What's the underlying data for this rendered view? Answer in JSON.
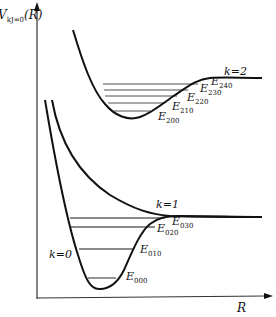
{
  "diagram": {
    "y_axis_label": "V",
    "y_axis_sub": "kJ=0",
    "y_axis_arg": "(R)",
    "x_axis_label": "R",
    "curves": [
      {
        "name": "k=0",
        "label": "k=0"
      },
      {
        "name": "k=1",
        "label": "k=1"
      },
      {
        "name": "k=2",
        "label": "k=2"
      }
    ],
    "levels_k0": [
      {
        "label": "E",
        "sub": "000"
      },
      {
        "label": "E",
        "sub": "010"
      },
      {
        "label": "E",
        "sub": "020"
      },
      {
        "label": "E",
        "sub": "030"
      }
    ],
    "levels_k2": [
      {
        "label": "E",
        "sub": "200"
      },
      {
        "label": "E",
        "sub": "210"
      },
      {
        "label": "E",
        "sub": "220"
      },
      {
        "label": "E",
        "sub": "230"
      },
      {
        "label": "E",
        "sub": "240"
      }
    ],
    "colors": {
      "curve": "#111111",
      "level": "#8a8a8a",
      "axis": "#333333"
    }
  }
}
